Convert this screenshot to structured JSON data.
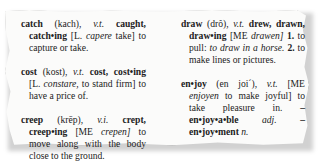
{
  "entries": [
    {
      "headword": "catch",
      "pron": "(kach),",
      "pos": "v.t.",
      "forms": "caught, catch•ing",
      "etym_open": "[L.",
      "etym_word": "capere",
      "etym_close": "take]",
      "definition": "to capture or take."
    },
    {
      "headword": "cost",
      "pron": "(kost),",
      "pos": "v.t.",
      "forms": "cost, cost•ing",
      "etym_open": "[L.",
      "etym_word": "constare,",
      "etym_close": "to stand firm]",
      "definition": "to have a price of."
    },
    {
      "headword": "creep",
      "pron": "(krēp),",
      "pos": "v.i.",
      "forms": "crept, creep•ing",
      "etym_open": "[ME",
      "etym_word": "crepen]",
      "etym_close": "",
      "definition": "to move along with the body close to the ground."
    },
    {
      "headword": "draw",
      "pron": "(drô),",
      "pos": "v.t.",
      "forms": "drew, drawn, draw•ing",
      "etym_open": "[ME",
      "etym_word": "drawen]",
      "sense1_num": "1.",
      "sense1_text": "to pull:",
      "sense1_example": "to draw in a horse.",
      "sense2_num": "2.",
      "sense2_text": "to make lines or pictures."
    },
    {
      "headword": "en•joy",
      "pron": "(en joi´),",
      "pos": "v.t.",
      "etym_open": "[ME",
      "etym_word": "enjoyen",
      "etym_close": "to make joyful]",
      "definition": "to take pleasure in.",
      "derived1": "–en•joy•a•ble",
      "derived1_pos": "adj.",
      "derived2": "–en•joy•ment",
      "derived2_pos": "n."
    }
  ]
}
